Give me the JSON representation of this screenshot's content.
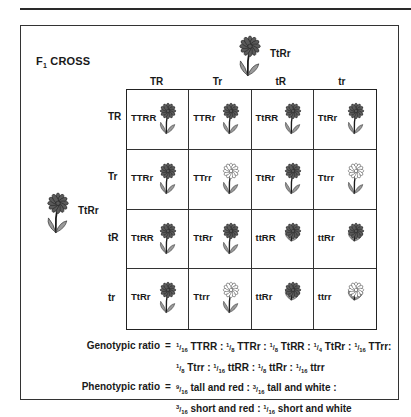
{
  "title": {
    "main": "F",
    "sub": "1",
    "rest": " CROSS"
  },
  "parent_top": {
    "genotype": "TtRr",
    "height": "tall",
    "color": "red"
  },
  "parent_left": {
    "genotype": "TtRr",
    "height": "tall",
    "color": "red"
  },
  "column_gametes": [
    "TR",
    "Tr",
    "tR",
    "tr"
  ],
  "row_gametes": [
    "TR",
    "Tr",
    "tR",
    "tr"
  ],
  "cells": [
    [
      {
        "g": "TTRR",
        "h": "tall",
        "c": "red"
      },
      {
        "g": "TTRr",
        "h": "tall",
        "c": "red"
      },
      {
        "g": "TtRR",
        "h": "tall",
        "c": "red"
      },
      {
        "g": "TtRr",
        "h": "tall",
        "c": "red"
      }
    ],
    [
      {
        "g": "TTRr",
        "h": "tall",
        "c": "red"
      },
      {
        "g": "TTrr",
        "h": "tall",
        "c": "white"
      },
      {
        "g": "TtRr",
        "h": "tall",
        "c": "red"
      },
      {
        "g": "Ttrr",
        "h": "tall",
        "c": "white"
      }
    ],
    [
      {
        "g": "TtRR",
        "h": "tall",
        "c": "red"
      },
      {
        "g": "TtRr",
        "h": "tall",
        "c": "red"
      },
      {
        "g": "ttRR",
        "h": "short",
        "c": "red"
      },
      {
        "g": "ttRr",
        "h": "short",
        "c": "red"
      }
    ],
    [
      {
        "g": "TtRr",
        "h": "tall",
        "c": "red"
      },
      {
        "g": "Ttrr",
        "h": "tall",
        "c": "white"
      },
      {
        "g": "ttRr",
        "h": "short",
        "c": "red"
      },
      {
        "g": "ttrr",
        "h": "short",
        "c": "white"
      }
    ]
  ],
  "genotypic": {
    "label": "Genotypic ratio",
    "eq": "=",
    "line1": [
      [
        "1/16",
        "TTRR"
      ],
      [
        "1/8",
        "TTRr"
      ],
      [
        "1/8",
        "TtRR"
      ],
      [
        "1/4",
        "TtRr"
      ],
      [
        "1/16",
        "TTrr"
      ]
    ],
    "line2": [
      [
        "1/8",
        "Ttrr"
      ],
      [
        "1/16",
        "ttRR"
      ],
      [
        "1/8",
        "ttRr"
      ],
      [
        "1/16",
        "ttrr"
      ]
    ]
  },
  "phenotypic": {
    "label": "Phenotypic ratio",
    "eq": "=",
    "line1": [
      [
        "9/16",
        "tall and red"
      ],
      [
        "3/16",
        "tall and white"
      ]
    ],
    "line2": [
      [
        "3/16",
        "short and red"
      ],
      [
        "1/16",
        "short and white"
      ]
    ]
  },
  "colors": {
    "red_petal": "#5a5a5a",
    "white_petal": "#ffffff",
    "leaf": "#9a9a9a",
    "stroke": "#1a1a1a"
  }
}
